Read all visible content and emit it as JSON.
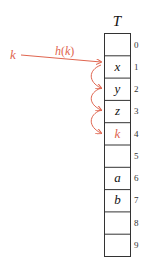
{
  "table": {
    "title": "T",
    "rows": [
      {
        "index": "0",
        "value": ""
      },
      {
        "index": "1",
        "value": "x"
      },
      {
        "index": "2",
        "value": "y"
      },
      {
        "index": "3",
        "value": "z"
      },
      {
        "index": "4",
        "value": "k",
        "highlight": true
      },
      {
        "index": "5",
        "value": ""
      },
      {
        "index": "6",
        "value": "a"
      },
      {
        "index": "7",
        "value": "b"
      },
      {
        "index": "8",
        "value": ""
      },
      {
        "index": "9",
        "value": ""
      }
    ]
  },
  "key": {
    "label": "k"
  },
  "hash_arrow": {
    "label": "h(k)",
    "h": "h",
    "open": "(",
    "arg": "k",
    "close": ")"
  },
  "colors": {
    "accent": "#e0654f",
    "line": "#333333",
    "text": "#111111"
  }
}
